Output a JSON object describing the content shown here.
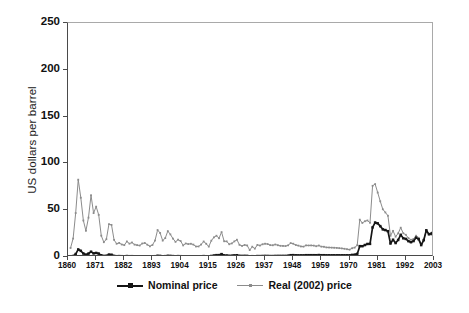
{
  "chart_data": {
    "type": "line",
    "title": "",
    "xlabel": "",
    "ylabel": "US dollars per barrel",
    "xlim": [
      1860,
      2003
    ],
    "ylim": [
      0,
      250
    ],
    "grid": false,
    "legend_position": "bottom-center",
    "xticks": [
      "1860",
      "1871",
      "1882",
      "1893",
      "1904",
      "1915",
      "1926",
      "1937",
      "1948",
      "1959",
      "1970",
      "1981",
      "1992",
      "2003"
    ],
    "yticks": [
      "0",
      "50",
      "100",
      "150",
      "200",
      "250"
    ],
    "colors": {
      "nominal": "#151515",
      "real": "#8c8c8c",
      "axis": "#4a4a4a",
      "frame": "#a9a9a9",
      "background": "#ffffff"
    },
    "x": [
      1861,
      1862,
      1863,
      1864,
      1865,
      1866,
      1867,
      1868,
      1869,
      1870,
      1871,
      1872,
      1873,
      1874,
      1875,
      1876,
      1877,
      1878,
      1879,
      1880,
      1881,
      1882,
      1883,
      1884,
      1885,
      1886,
      1887,
      1888,
      1889,
      1890,
      1891,
      1892,
      1893,
      1894,
      1895,
      1896,
      1897,
      1898,
      1899,
      1900,
      1901,
      1902,
      1903,
      1904,
      1905,
      1906,
      1907,
      1908,
      1909,
      1910,
      1911,
      1912,
      1913,
      1914,
      1915,
      1916,
      1917,
      1918,
      1919,
      1920,
      1921,
      1922,
      1923,
      1924,
      1925,
      1926,
      1927,
      1928,
      1929,
      1930,
      1931,
      1932,
      1933,
      1934,
      1935,
      1936,
      1937,
      1938,
      1939,
      1940,
      1941,
      1942,
      1943,
      1944,
      1945,
      1946,
      1947,
      1948,
      1949,
      1950,
      1951,
      1952,
      1953,
      1954,
      1955,
      1956,
      1957,
      1958,
      1959,
      1960,
      1961,
      1962,
      1963,
      1964,
      1965,
      1966,
      1967,
      1968,
      1969,
      1970,
      1971,
      1972,
      1973,
      1974,
      1975,
      1976,
      1977,
      1978,
      1979,
      1980,
      1981,
      1982,
      1983,
      1984,
      1985,
      1986,
      1987,
      1988,
      1989,
      1990,
      1991,
      1992,
      1993,
      1994,
      1995,
      1996,
      1997,
      1998,
      1999,
      2000,
      2001,
      2002,
      2003
    ],
    "series": [
      {
        "name": "Nominal price",
        "marker": "square",
        "color": "#151515",
        "values": [
          0.49,
          1.05,
          3.15,
          8.06,
          6.59,
          3.74,
          2.41,
          3.62,
          5.64,
          3.86,
          4.34,
          3.64,
          1.83,
          1.17,
          1.35,
          2.56,
          2.42,
          1.19,
          0.86,
          0.95,
          0.86,
          0.78,
          1.0,
          0.84,
          0.88,
          0.71,
          0.67,
          0.65,
          0.77,
          0.77,
          0.67,
          0.56,
          0.64,
          0.84,
          1.36,
          1.18,
          0.79,
          0.91,
          1.29,
          1.19,
          0.96,
          0.8,
          0.94,
          0.86,
          0.62,
          0.73,
          0.72,
          0.72,
          0.7,
          0.61,
          0.61,
          0.74,
          0.95,
          0.81,
          0.64,
          1.1,
          1.56,
          1.98,
          2.01,
          3.07,
          1.73,
          1.61,
          1.34,
          1.43,
          1.68,
          1.88,
          1.3,
          1.17,
          1.27,
          1.19,
          0.65,
          0.87,
          0.67,
          1.0,
          0.97,
          1.09,
          1.18,
          1.13,
          1.02,
          1.02,
          1.14,
          1.19,
          1.2,
          1.21,
          1.22,
          1.41,
          1.93,
          1.99,
          1.78,
          1.71,
          1.71,
          1.71,
          1.93,
          1.93,
          1.93,
          1.93,
          1.9,
          2.08,
          1.9,
          1.9,
          1.8,
          1.8,
          1.8,
          1.8,
          1.8,
          1.8,
          1.8,
          1.8,
          1.8,
          1.8,
          2.24,
          2.48,
          3.29,
          11.58,
          11.53,
          12.8,
          13.92,
          14.02,
          31.61,
          36.83,
          35.93,
          32.97,
          29.55,
          28.78,
          27.56,
          14.43,
          18.44,
          14.92,
          18.23,
          23.73,
          20.0,
          19.32,
          16.97,
          15.82,
          17.02,
          20.67,
          19.09,
          12.72,
          17.97,
          28.5,
          24.44,
          25.02,
          28.83
        ]
      },
      {
        "name": "Real (2002) price",
        "marker": "dot",
        "color": "#8c8c8c",
        "values": [
          9.68,
          19.7,
          46.95,
          82.62,
          63.34,
          38.99,
          27.97,
          42.05,
          66.0,
          46.88,
          53.8,
          45.02,
          22.77,
          15.8,
          19.01,
          35.09,
          34.32,
          18.29,
          14.16,
          15.06,
          13.36,
          12.67,
          16.61,
          14.27,
          15.49,
          13.25,
          12.68,
          12.28,
          14.4,
          15.0,
          13.15,
          11.4,
          12.87,
          17.58,
          28.84,
          25.64,
          17.51,
          20.19,
          27.68,
          24.16,
          19.65,
          16.2,
          18.53,
          17.05,
          12.38,
          14.44,
          13.8,
          14.14,
          13.25,
          11.21,
          11.26,
          13.29,
          16.56,
          14.15,
          11.1,
          17.46,
          20.99,
          22.7,
          20.04,
          26.61,
          16.82,
          16.68,
          13.62,
          14.53,
          16.67,
          18.46,
          13.0,
          11.85,
          12.85,
          12.34,
          7.39,
          11.01,
          8.94,
          12.92,
          12.24,
          13.58,
          14.19,
          13.83,
          12.68,
          12.54,
          13.36,
          12.58,
          11.95,
          11.85,
          11.68,
          12.47,
          14.84,
          14.2,
          12.82,
          12.17,
          11.28,
          11.09,
          12.4,
          12.32,
          12.36,
          12.18,
          11.51,
          12.26,
          11.1,
          10.93,
          10.25,
          10.14,
          10.01,
          9.88,
          9.72,
          9.45,
          9.17,
          8.78,
          8.33,
          7.87,
          9.36,
          10.05,
          12.58,
          39.89,
          36.39,
          38.19,
          39.02,
          36.53,
          76.05,
          77.89,
          68.85,
          59.52,
          50.99,
          47.62,
          44.08,
          22.64,
          27.93,
          21.71,
          25.3,
          31.31,
          25.32,
          23.75,
          20.24,
          18.42,
          19.28,
          22.74,
          20.53,
          13.47,
          18.61,
          28.56,
          23.8,
          23.86,
          26.95
        ]
      }
    ]
  }
}
